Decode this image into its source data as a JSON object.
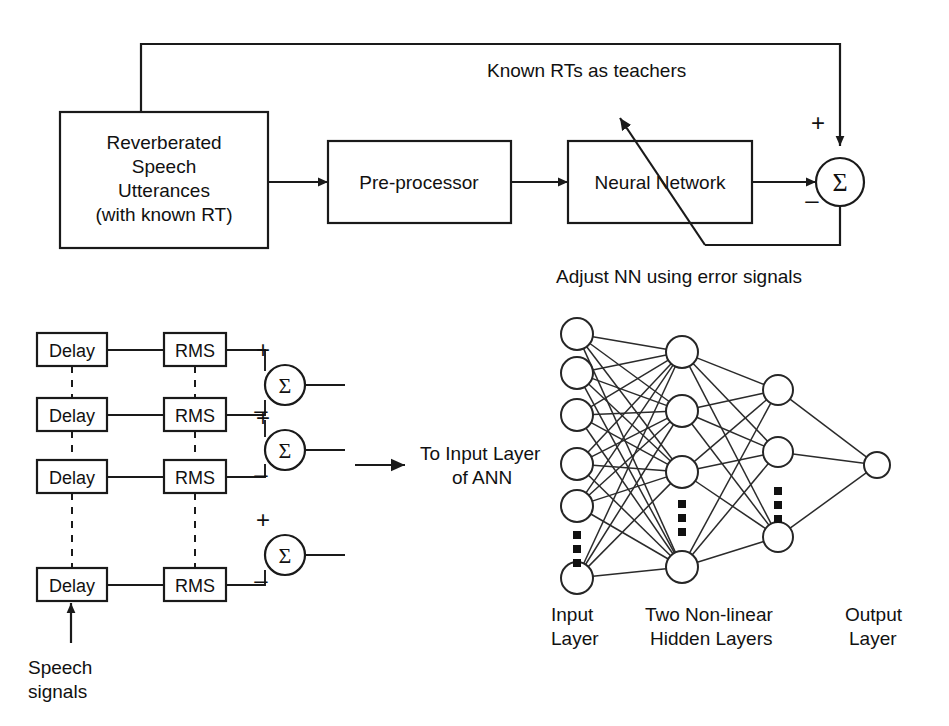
{
  "figure": {
    "ink_color": "#1a1a1a",
    "background": "#ffffff"
  },
  "top_diagram": {
    "blocks": [
      {
        "id": "source",
        "label_lines": [
          "Reverberated",
          "Speech",
          "Utterances",
          "(with known RT)"
        ]
      },
      {
        "id": "preprocessor",
        "label_lines": [
          "Pre-processor"
        ]
      },
      {
        "id": "neural_network",
        "label_lines": [
          "Neural Network"
        ]
      }
    ],
    "summing_junction": {
      "symbol": "Σ",
      "plus_sign": "+",
      "minus_sign": "–"
    },
    "annotations": [
      {
        "id": "teacher_signal",
        "text": "Known RTs as teachers"
      },
      {
        "id": "error_feedback",
        "text": "Adjust NN using error signals"
      }
    ]
  },
  "bottom_left": {
    "rows": [
      {
        "delay": "Delay",
        "rms": "RMS"
      },
      {
        "delay": "Delay",
        "rms": "RMS"
      },
      {
        "delay": "Delay",
        "rms": "RMS"
      },
      {
        "delay": "Delay",
        "rms": "RMS"
      }
    ],
    "summers": [
      {
        "symbol": "Σ",
        "plus_sign": "+",
        "minus_sign": "–"
      },
      {
        "symbol": "Σ",
        "plus_sign": "+",
        "minus_sign": "–"
      },
      {
        "symbol": "Σ",
        "plus_sign": "+",
        "minus_sign": "–"
      }
    ],
    "input_label_lines": [
      "Speech",
      "signals"
    ],
    "output_label_lines": [
      "To Input Layer",
      "of ANN"
    ]
  },
  "ann": {
    "layer_labels": [
      {
        "id": "input",
        "lines": [
          "Input",
          "Layer"
        ]
      },
      {
        "id": "hidden",
        "lines": [
          "Two Non-linear",
          "Hidden Layers"
        ]
      },
      {
        "id": "output",
        "lines": [
          "Output",
          "Layer"
        ]
      }
    ],
    "counts": {
      "input_nodes": 6,
      "hidden1_nodes": 4,
      "hidden2_nodes": 3,
      "output_nodes": 1
    },
    "ellipsis_glyph": "▪"
  }
}
